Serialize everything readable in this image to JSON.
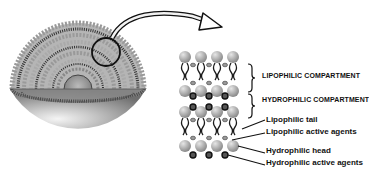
{
  "diagram": {
    "compartments": [
      {
        "label": "LIPOPHILIC COMPARTMENT"
      },
      {
        "label": "HYDROPHILIC COMPARTMENT"
      }
    ],
    "annotations": [
      {
        "label": "Lipophilic tail"
      },
      {
        "label": "Lipophilic active agents"
      },
      {
        "label": "Hydrophilic head"
      },
      {
        "label": "Hydrophilic active agents"
      }
    ],
    "colors": {
      "head": "#a9a9a9",
      "tail": "#1a1a1a",
      "hydrophilic_agent": "#333333",
      "sphere_shell": "#bdbdbd",
      "text": "#111111"
    }
  }
}
